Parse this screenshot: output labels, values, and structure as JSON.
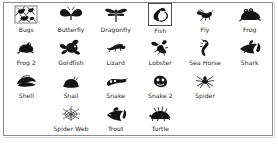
{
  "panel": {
    "name": "clipart-gallery",
    "border_color": "#8a8a8a",
    "background": "#ffffff",
    "selected_item": "Fish"
  },
  "footer": {
    "caption": ""
  },
  "rows": [
    [
      {
        "label": "Bugs",
        "icon": "bugs-icon",
        "selected": false
      },
      {
        "label": "Butterfly",
        "icon": "butterfly-icon",
        "selected": false
      },
      {
        "label": "Dragonfly",
        "icon": "dragonfly-icon",
        "selected": false
      },
      {
        "label": "Fish",
        "icon": "fish-icon",
        "selected": true
      },
      {
        "label": "Fly",
        "icon": "fly-icon",
        "selected": false
      },
      {
        "label": "Frog",
        "icon": "frog-icon",
        "selected": false
      }
    ],
    [
      {
        "label": "Frog 2",
        "icon": "frog-2-icon",
        "selected": false
      },
      {
        "label": "Goldfish",
        "icon": "goldfish-icon",
        "selected": false
      },
      {
        "label": "Lizard",
        "icon": "lizard-icon",
        "selected": false
      },
      {
        "label": "Lobster",
        "icon": "lobster-icon",
        "selected": false
      },
      {
        "label": "Sea Horse",
        "icon": "sea-horse-icon",
        "selected": false
      },
      {
        "label": "Shark",
        "icon": "shark-icon",
        "selected": false
      }
    ],
    [
      {
        "label": "Shell",
        "icon": "shell-icon",
        "selected": false
      },
      {
        "label": "Snail",
        "icon": "snail-icon",
        "selected": false
      },
      {
        "label": "Snake",
        "icon": "snake-icon",
        "selected": false
      },
      {
        "label": "Snake 2",
        "icon": "snake-2-icon",
        "selected": false
      },
      {
        "label": "Spider",
        "icon": "spider-icon",
        "selected": false
      },
      {
        "label": "",
        "icon": "",
        "empty": true
      }
    ],
    [
      {
        "label": "",
        "icon": "",
        "empty": true
      },
      {
        "label": "Spider Web",
        "icon": "spider-web-icon",
        "selected": false
      },
      {
        "label": "Trout",
        "icon": "trout-icon",
        "selected": false
      },
      {
        "label": "Turtle",
        "icon": "turtle-icon",
        "selected": false
      },
      {
        "label": "",
        "icon": "",
        "empty": true
      },
      {
        "label": "",
        "icon": "",
        "empty": true
      }
    ]
  ]
}
